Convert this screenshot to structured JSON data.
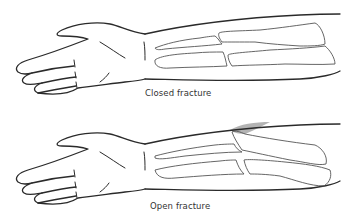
{
  "figure": {
    "panels": [
      {
        "id": "closed",
        "caption": "Closed fracture"
      },
      {
        "id": "open",
        "caption": "Open fracture"
      }
    ],
    "colors": {
      "outline": "#2a2a2a",
      "bone_outline": "#555555",
      "wound_shading": "#9a9a9a",
      "background": "#ffffff",
      "caption_text": "#333333"
    }
  }
}
